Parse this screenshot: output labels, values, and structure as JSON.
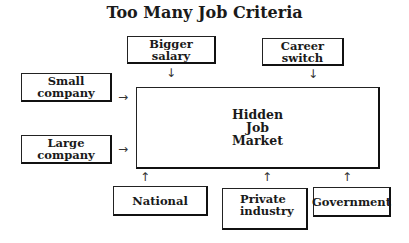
{
  "title": "Too Many Job Criteria",
  "center": {
    "line1": "Hidden",
    "line2": "Job",
    "line3": "Market"
  },
  "top_inputs": [
    {
      "label": "Bigger salary"
    },
    {
      "label": "Career switch"
    }
  ],
  "left_inputs": [
    {
      "label": "Small company"
    },
    {
      "label": "Large company"
    }
  ],
  "bottom_inputs": [
    {
      "label": "National"
    },
    {
      "label_line1": "Private",
      "label_line2": "industry"
    },
    {
      "label": "Government"
    }
  ],
  "arrows": {
    "down": "↓",
    "right": "→",
    "up": "↑"
  }
}
